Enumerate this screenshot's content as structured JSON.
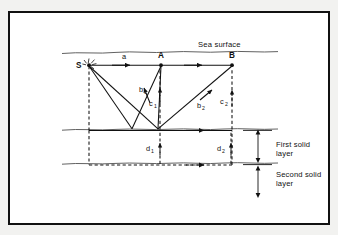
{
  "figure": {
    "border_color": "#111111",
    "background_color": "#ffffff",
    "ray_color": "#111111"
  },
  "labels": {
    "sea_surface": "Sea surface",
    "first_solid_layer_line1": "First solid",
    "first_solid_layer_line2": "layer",
    "second_solid_layer_line1": "Second solid",
    "second_solid_layer_line2": "layer"
  },
  "points": [
    {
      "id": "S",
      "label": "S",
      "x": 88,
      "y": 65,
      "role": "source"
    },
    {
      "id": "A",
      "label": "A",
      "x": 161,
      "y": 65,
      "role": "receiver"
    },
    {
      "id": "B",
      "label": "B",
      "x": 232,
      "y": 65,
      "role": "receiver"
    }
  ],
  "ray_labels": [
    {
      "id": "a",
      "base": "a",
      "sub": "",
      "x": 124,
      "y": 59,
      "style": "solid"
    },
    {
      "id": "b1",
      "base": "b",
      "sub": "1",
      "x": 142,
      "y": 92,
      "style": "solid"
    },
    {
      "id": "c1",
      "base": "c",
      "sub": "1",
      "x": 152,
      "y": 106,
      "style": "dashed"
    },
    {
      "id": "b2",
      "base": "b",
      "sub": "2",
      "x": 200,
      "y": 107,
      "style": "solid"
    },
    {
      "id": "c2",
      "base": "c",
      "sub": "2",
      "x": 224,
      "y": 104,
      "style": "dashed"
    },
    {
      "id": "d1",
      "base": "d",
      "sub": "1",
      "x": 148,
      "y": 150,
      "style": "dashed"
    },
    {
      "id": "d2",
      "base": "d",
      "sub": "2",
      "x": 219,
      "y": 150,
      "style": "dashed"
    }
  ],
  "boundaries": {
    "sea_surface_y": 52,
    "seabed_y": 129,
    "second_layer_y": 163
  },
  "layer_brackets": [
    {
      "id": "first",
      "top": 130,
      "bottom": 162,
      "x": 258
    },
    {
      "id": "second",
      "top": 164,
      "bottom": 196,
      "x": 258
    }
  ]
}
